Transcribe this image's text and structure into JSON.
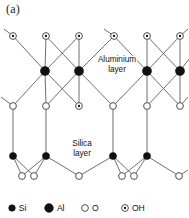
{
  "figure": {
    "panel_label": "(a)",
    "caption_labels": {
      "aluminium_layer_line1": "Aluminium",
      "aluminium_layer_line2": "layer",
      "silica_layer_line1": "Silica",
      "silica_layer_line2": "layer"
    },
    "colors": {
      "background": "#ffffff",
      "bond": "#555555",
      "atom_fill_dark": "#111111",
      "atom_fill_open": "#ffffff",
      "atom_stroke_open": "#3a3a3a",
      "text": "#111111"
    }
  },
  "legend": {
    "items": [
      {
        "symbol": "si",
        "label": "Si",
        "marker": "filled-circle-small",
        "x": 12,
        "y": 208,
        "r": 3.3
      },
      {
        "symbol": "al",
        "label": "Al",
        "marker": "filled-circle-large",
        "x": 49,
        "y": 208,
        "r": 4.4
      },
      {
        "symbol": "o",
        "label": "O",
        "marker": "open-circle",
        "x": 85,
        "y": 208,
        "r": 3.4
      },
      {
        "symbol": "oh",
        "label": "OH",
        "marker": "open-circle-with-dot",
        "x": 125,
        "y": 208,
        "r": 3.4
      }
    ]
  },
  "layer_labels": [
    {
      "name": "aluminium-layer-label",
      "lines": [
        "Aluminium",
        "layer"
      ],
      "x": 117,
      "y": 62
    },
    {
      "name": "silica-layer-label",
      "lines": [
        "Silica",
        "layer"
      ],
      "x": 82,
      "y": 146
    }
  ],
  "structure": {
    "atoms": [
      {
        "id": "oh_t1",
        "type": "OH",
        "x": 13,
        "y": 36,
        "r": 3.4
      },
      {
        "id": "oh_t2",
        "type": "OH",
        "x": 46,
        "y": 36,
        "r": 3.4
      },
      {
        "id": "oh_t3",
        "type": "OH",
        "x": 79,
        "y": 36,
        "r": 3.4
      },
      {
        "id": "oh_t4",
        "type": "OH",
        "x": 114,
        "y": 36,
        "r": 3.4
      },
      {
        "id": "oh_t5",
        "type": "OH",
        "x": 147,
        "y": 36,
        "r": 3.4
      },
      {
        "id": "oh_t6",
        "type": "OH",
        "x": 180,
        "y": 36,
        "r": 3.4
      },
      {
        "id": "al1",
        "type": "Al",
        "x": 45,
        "y": 71,
        "r": 4.6
      },
      {
        "id": "al2",
        "type": "Al",
        "x": 79,
        "y": 71,
        "r": 4.6
      },
      {
        "id": "al3",
        "type": "Al",
        "x": 147,
        "y": 71,
        "r": 4.6
      },
      {
        "id": "al4",
        "type": "Al",
        "x": 180,
        "y": 71,
        "r": 4.6
      },
      {
        "id": "o_m1",
        "type": "O",
        "x": 13,
        "y": 106,
        "r": 3.4
      },
      {
        "id": "o_m2",
        "type": "O",
        "x": 46,
        "y": 106,
        "r": 3.4
      },
      {
        "id": "oh_m3",
        "type": "OH",
        "x": 79,
        "y": 106,
        "r": 3.4
      },
      {
        "id": "o_m4",
        "type": "O",
        "x": 113,
        "y": 106,
        "r": 3.4
      },
      {
        "id": "o_m5",
        "type": "O",
        "x": 147,
        "y": 106,
        "r": 3.4
      },
      {
        "id": "o_m6",
        "type": "O",
        "x": 180,
        "y": 106,
        "r": 3.4
      },
      {
        "id": "si1",
        "type": "Si",
        "x": 13,
        "y": 156,
        "r": 3.6
      },
      {
        "id": "si2",
        "type": "Si",
        "x": 46,
        "y": 156,
        "r": 3.6
      },
      {
        "id": "si3",
        "type": "Si",
        "x": 113,
        "y": 156,
        "r": 3.6
      },
      {
        "id": "si4",
        "type": "Si",
        "x": 147,
        "y": 156,
        "r": 3.6
      },
      {
        "id": "o_b1",
        "type": "O",
        "x": 22,
        "y": 176,
        "r": 3.4
      },
      {
        "id": "o_b2",
        "type": "O",
        "x": 34,
        "y": 176,
        "r": 3.4
      },
      {
        "id": "o_b3",
        "type": "O",
        "x": 79,
        "y": 176,
        "r": 3.4
      },
      {
        "id": "o_b4",
        "type": "O",
        "x": 122,
        "y": 176,
        "r": 3.4
      },
      {
        "id": "o_b5",
        "type": "O",
        "x": 134,
        "y": 176,
        "r": 3.4
      },
      {
        "id": "o_b6",
        "type": "O",
        "x": 179,
        "y": 176,
        "r": 3.4
      }
    ],
    "bonds": [
      {
        "from": "oh_t1",
        "to": "al1"
      },
      {
        "from": "oh_t2",
        "to": "al1"
      },
      {
        "from": "oh_t2",
        "to": "al2"
      },
      {
        "from": "oh_t3",
        "to": "al1"
      },
      {
        "from": "oh_t3",
        "to": "al2"
      },
      {
        "from": "oh_t4",
        "to": "al2"
      },
      {
        "from": "oh_t4",
        "to": "al3"
      },
      {
        "from": "oh_t5",
        "to": "al3"
      },
      {
        "from": "oh_t5",
        "to": "al4"
      },
      {
        "from": "oh_t6",
        "to": "al3"
      },
      {
        "from": "oh_t6",
        "to": "al4"
      },
      {
        "from": "al1",
        "to": "o_m1"
      },
      {
        "from": "al1",
        "to": "o_m2"
      },
      {
        "from": "al1",
        "to": "oh_m3"
      },
      {
        "from": "al2",
        "to": "o_m2"
      },
      {
        "from": "al2",
        "to": "oh_m3"
      },
      {
        "from": "al2",
        "to": "o_m4"
      },
      {
        "from": "al3",
        "to": "o_m4"
      },
      {
        "from": "al3",
        "to": "o_m5"
      },
      {
        "from": "al3",
        "to": "o_m6"
      },
      {
        "from": "al4",
        "to": "o_m5"
      },
      {
        "from": "al4",
        "to": "o_m6"
      },
      {
        "from": "o_m1",
        "to": "si1"
      },
      {
        "from": "o_m2",
        "to": "si2"
      },
      {
        "from": "o_m4",
        "to": "si3"
      },
      {
        "from": "o_m5",
        "to": "si4"
      },
      {
        "from": "si1",
        "to": "o_b1"
      },
      {
        "from": "si1",
        "to": "o_b2"
      },
      {
        "from": "si2",
        "to": "o_b1"
      },
      {
        "from": "si2",
        "to": "o_b2"
      },
      {
        "from": "si2",
        "to": "o_b3"
      },
      {
        "from": "si3",
        "to": "o_b3"
      },
      {
        "from": "si3",
        "to": "o_b4"
      },
      {
        "from": "si3",
        "to": "o_b5"
      },
      {
        "from": "si4",
        "to": "o_b4"
      },
      {
        "from": "si4",
        "to": "o_b5"
      },
      {
        "from": "si4",
        "to": "o_b6"
      }
    ],
    "open_bonds": [
      {
        "from": "oh_t1",
        "dx": -9,
        "dy": -7
      },
      {
        "from": "oh_t4",
        "dx": -10,
        "dy": -7
      },
      {
        "from": "oh_t6",
        "dx": 8,
        "dy": -7
      },
      {
        "from": "al4",
        "dx": 9,
        "dy": -12
      },
      {
        "from": "o_m1",
        "dx": -12,
        "dy": -9
      },
      {
        "from": "o_m6",
        "dx": 8,
        "dy": -9
      },
      {
        "from": "o_b6",
        "dx": 9,
        "dy": -6
      }
    ]
  }
}
